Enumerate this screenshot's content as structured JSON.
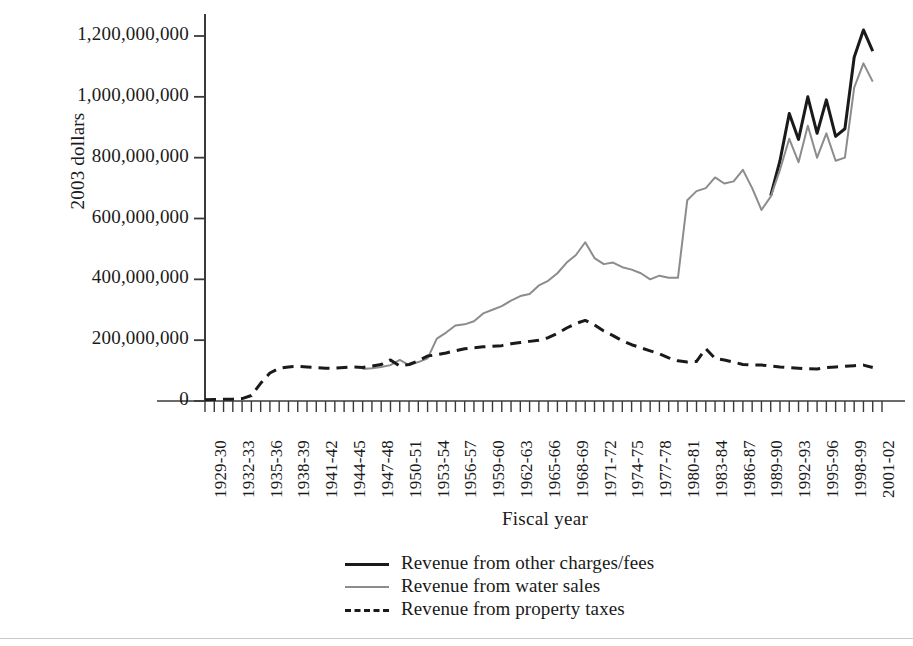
{
  "chart_data": {
    "type": "line",
    "title": "",
    "xlabel": "Fiscal year",
    "ylabel": "2003 dollars",
    "ylim": [
      0,
      1280000000
    ],
    "yticks": [
      0,
      200000000,
      400000000,
      600000000,
      800000000,
      1000000000,
      1200000000
    ],
    "ytick_labels": [
      "0",
      "200,000,000",
      "400,000,000",
      "600,000,000",
      "800,000,000",
      "1,000,000,000",
      "1,200,000,000"
    ],
    "grid": false,
    "legend_position": "bottom-center",
    "x_tick_labels_every": 3,
    "categories": [
      "1929-30",
      "1930-31",
      "1931-32",
      "1932-33",
      "1933-34",
      "1934-35",
      "1935-36",
      "1936-37",
      "1937-38",
      "1938-39",
      "1939-40",
      "1940-41",
      "1941-42",
      "1942-43",
      "1943-44",
      "1944-45",
      "1945-46",
      "1946-47",
      "1947-48",
      "1948-49",
      "1949-50",
      "1950-51",
      "1951-52",
      "1952-53",
      "1953-54",
      "1954-55",
      "1955-56",
      "1956-57",
      "1957-58",
      "1958-59",
      "1959-60",
      "1960-61",
      "1961-62",
      "1962-63",
      "1963-64",
      "1964-65",
      "1965-66",
      "1966-67",
      "1967-68",
      "1968-69",
      "1969-70",
      "1970-71",
      "1971-72",
      "1972-73",
      "1973-74",
      "1974-75",
      "1975-76",
      "1976-77",
      "1977-78",
      "1978-79",
      "1979-80",
      "1980-81",
      "1981-82",
      "1982-83",
      "1983-84",
      "1984-85",
      "1985-86",
      "1986-87",
      "1987-88",
      "1988-89",
      "1989-90",
      "1990-91",
      "1991-92",
      "1992-93",
      "1993-94",
      "1994-95",
      "1995-96",
      "1996-97",
      "1997-98",
      "1998-99",
      "1999-00",
      "2000-01",
      "2001-02",
      "2002-03"
    ],
    "xtick_labels": [
      "1929-30",
      "1932-33",
      "1935-36",
      "1938-39",
      "1941-42",
      "1944-45",
      "1947-48",
      "1950-51",
      "1953-54",
      "1956-57",
      "1959-60",
      "1962-63",
      "1965-66",
      "1968-69",
      "1971-72",
      "1974-75",
      "1977-78",
      "1980-81",
      "1983-84",
      "1986-87",
      "1989-90",
      "1992-93",
      "1995-96",
      "1998-99",
      "2001-02"
    ],
    "series": [
      {
        "name": "Revenue from other charges/fees",
        "color": "#1a1a1a",
        "style": "solid",
        "width": 3,
        "values": [
          null,
          null,
          null,
          null,
          null,
          null,
          null,
          null,
          null,
          null,
          null,
          null,
          null,
          null,
          null,
          null,
          null,
          null,
          null,
          null,
          null,
          null,
          null,
          null,
          null,
          null,
          null,
          null,
          null,
          null,
          null,
          null,
          null,
          null,
          null,
          null,
          null,
          null,
          null,
          null,
          null,
          null,
          null,
          null,
          null,
          null,
          null,
          null,
          null,
          null,
          null,
          null,
          null,
          null,
          null,
          null,
          null,
          null,
          null,
          null,
          null,
          675000000,
          790000000,
          945000000,
          860000000,
          1000000000,
          880000000,
          990000000,
          870000000,
          895000000,
          1130000000,
          1220000000,
          1150000000,
          null
        ]
      },
      {
        "name": "Revenue from water sales",
        "color": "#8c8c8c",
        "style": "solid",
        "width": 2,
        "values": [
          null,
          null,
          null,
          null,
          null,
          null,
          null,
          null,
          null,
          null,
          null,
          null,
          null,
          null,
          null,
          null,
          null,
          105000000,
          108000000,
          112000000,
          118000000,
          135000000,
          118000000,
          128000000,
          140000000,
          205000000,
          225000000,
          248000000,
          252000000,
          262000000,
          288000000,
          300000000,
          312000000,
          330000000,
          345000000,
          352000000,
          380000000,
          395000000,
          420000000,
          455000000,
          480000000,
          522000000,
          470000000,
          450000000,
          455000000,
          440000000,
          432000000,
          420000000,
          400000000,
          412000000,
          405000000,
          405000000,
          660000000,
          690000000,
          700000000,
          735000000,
          715000000,
          722000000,
          760000000,
          700000000,
          628000000,
          672000000,
          760000000,
          862000000,
          785000000,
          905000000,
          800000000,
          880000000,
          790000000,
          800000000,
          1030000000,
          1110000000,
          1050000000,
          null
        ]
      },
      {
        "name": "Revenue from property taxes",
        "color": "#1a1a1a",
        "style": "dashed",
        "width": 3,
        "values": [
          4000000,
          5000000,
          6000000,
          6000000,
          8000000,
          18000000,
          58000000,
          92000000,
          108000000,
          112000000,
          114000000,
          112000000,
          110000000,
          108000000,
          108000000,
          110000000,
          112000000,
          110000000,
          115000000,
          120000000,
          135000000,
          115000000,
          120000000,
          132000000,
          148000000,
          152000000,
          158000000,
          165000000,
          172000000,
          175000000,
          178000000,
          180000000,
          182000000,
          188000000,
          192000000,
          196000000,
          200000000,
          208000000,
          222000000,
          240000000,
          255000000,
          265000000,
          250000000,
          230000000,
          215000000,
          198000000,
          185000000,
          175000000,
          165000000,
          155000000,
          142000000,
          132000000,
          128000000,
          130000000,
          172000000,
          140000000,
          135000000,
          128000000,
          120000000,
          118000000,
          118000000,
          115000000,
          112000000,
          110000000,
          108000000,
          106000000,
          105000000,
          110000000,
          112000000,
          114000000,
          116000000,
          118000000,
          110000000,
          null
        ]
      }
    ]
  },
  "legend": {
    "items": [
      {
        "label": "Revenue from other charges/fees",
        "swatch": "solid-black-line-icon"
      },
      {
        "label": "Revenue from water sales",
        "swatch": "solid-gray-line-icon"
      },
      {
        "label": "Revenue from property taxes",
        "swatch": "dashed-black-line-icon"
      }
    ]
  }
}
